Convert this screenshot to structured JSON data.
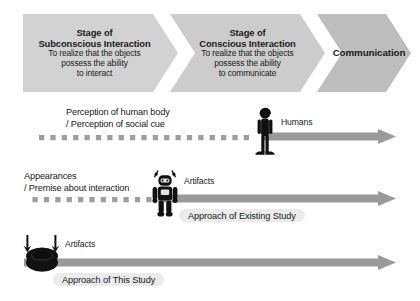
{
  "diagram": {
    "title_hidden": "Stages of interaction between humans and artifacts",
    "stages": [
      {
        "id": "subconscious",
        "title_line1": "Stage of",
        "title_line2": "Subconscious Interaction",
        "sub_line1": "To realize that the objects",
        "sub_line2": "possess the ability",
        "sub_line3": "to interact",
        "fill": "#d2d2d2"
      },
      {
        "id": "conscious",
        "title_line1": "Stage of",
        "title_line2": "Conscious Interaction",
        "sub_line1": "To realize that the objects",
        "sub_line2": "possess the ability",
        "sub_line3": "to communicate",
        "fill": "#cccccc"
      },
      {
        "id": "communication",
        "title_line1": "Communication",
        "title_line2": "",
        "sub_line1": "",
        "sub_line2": "",
        "sub_line3": "",
        "fill": "#bdbdbd"
      }
    ],
    "rows": [
      {
        "id": "humans",
        "label_line1": "Perception of human body",
        "label_line2": "/ Perception of social cue",
        "actor_label": "Humans",
        "actor_icon": "human-figure-icon",
        "approach_label": ""
      },
      {
        "id": "artifacts-existing",
        "label_line1": "Appearances",
        "label_line2": "/ Premise about interaction",
        "actor_label": "Artifacts",
        "actor_icon": "robot-figure-icon",
        "approach_label": "Approach of Existing Study"
      },
      {
        "id": "artifacts-this-study",
        "label_line1": "",
        "label_line2": "",
        "actor_label": "Artifacts",
        "actor_icon": "disc-robot-icon",
        "approach_label": "Approach of This Study"
      }
    ],
    "colors": {
      "arrow_gray": "#9a9a9a",
      "dot_gray": "#9e9e9e",
      "figure_black": "#111111",
      "pill_gray": "#dedede"
    }
  }
}
